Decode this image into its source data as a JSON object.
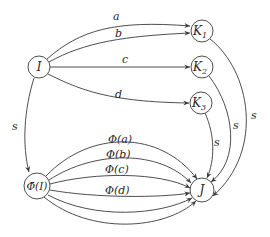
{
  "diagram": {
    "nodes": {
      "I": {
        "label": "I",
        "x": 39,
        "y": 67,
        "r": 11
      },
      "K1": {
        "label": "K",
        "sub": "1",
        "x": 202,
        "y": 31,
        "r": 11
      },
      "K2": {
        "label": "K",
        "sub": "2",
        "x": 202,
        "y": 67,
        "r": 11
      },
      "K3": {
        "label": "K",
        "sub": "3",
        "x": 201,
        "y": 103,
        "r": 11
      },
      "PhiI": {
        "label": "Φ̄(I)",
        "x": 37,
        "y": 186,
        "r": 13
      },
      "J": {
        "label": "J",
        "x": 202,
        "y": 190,
        "r": 12
      }
    },
    "edge_labels": {
      "a": "a",
      "b": "b",
      "c": "c",
      "d": "d",
      "s_I_Phi": "s",
      "s_K1_J": "s",
      "s_K2_J": "s",
      "s_K3_J": "s",
      "Phi_a": "Φ(a)",
      "Phi_b": "Φ(b)",
      "Phi_c": "Φ(c)",
      "Phi_d": "Φ(d)"
    },
    "edges": [
      {
        "from": "I",
        "to": "K1",
        "label": "a"
      },
      {
        "from": "I",
        "to": "K1",
        "label": "b"
      },
      {
        "from": "I",
        "to": "K2",
        "label": "c"
      },
      {
        "from": "I",
        "to": "K3",
        "label": "d"
      },
      {
        "from": "I",
        "to": "PhiI",
        "label": "s"
      },
      {
        "from": "K1",
        "to": "J",
        "label": "s"
      },
      {
        "from": "K2",
        "to": "J",
        "label": "s"
      },
      {
        "from": "K3",
        "to": "J",
        "label": "s"
      },
      {
        "from": "PhiI",
        "to": "J",
        "label": "Φ(a)"
      },
      {
        "from": "PhiI",
        "to": "J",
        "label": "Φ(b)"
      },
      {
        "from": "PhiI",
        "to": "J",
        "label": "Φ(c)"
      },
      {
        "from": "PhiI",
        "to": "J",
        "label": "Φ(d)"
      },
      {
        "from": "PhiI",
        "to": "J",
        "label": ""
      },
      {
        "from": "PhiI",
        "to": "J",
        "label": ""
      }
    ]
  }
}
